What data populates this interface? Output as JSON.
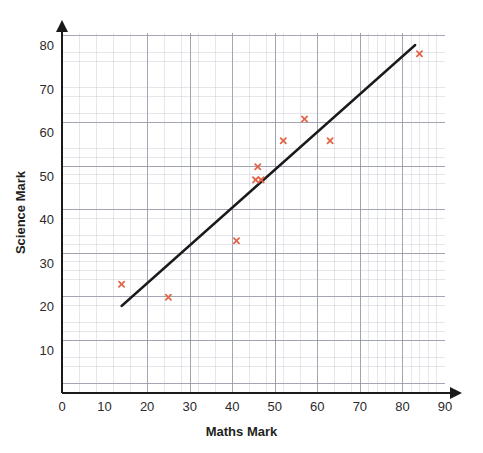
{
  "chart_data": {
    "type": "scatter",
    "title": "",
    "xlabel": "Maths Mark",
    "ylabel": "Science Mark",
    "xlim": [
      0,
      90
    ],
    "ylim": [
      0,
      85
    ],
    "xticks": [
      0,
      10,
      20,
      30,
      40,
      50,
      60,
      70,
      80,
      90
    ],
    "yticks": [
      10,
      20,
      30,
      40,
      50,
      60,
      70,
      80
    ],
    "xtick_labels": [
      "0",
      "10",
      "20",
      "30",
      "40",
      "50",
      "60",
      "70",
      "80",
      "90"
    ],
    "ytick_labels": [
      "10",
      "20",
      "30",
      "40",
      "50",
      "60",
      "70",
      "80"
    ],
    "grid": true,
    "grid_major_step": 10,
    "grid_minor_step": 2,
    "legend": "none",
    "marker_symbol": "x",
    "marker_color": "#e0674a",
    "points": [
      {
        "x": 14,
        "y": 25
      },
      {
        "x": 25,
        "y": 22
      },
      {
        "x": 41,
        "y": 35
      },
      {
        "x": 46,
        "y": 52
      },
      {
        "x": 45.5,
        "y": 49
      },
      {
        "x": 46.8,
        "y": 49
      },
      {
        "x": 52,
        "y": 58
      },
      {
        "x": 57,
        "y": 63
      },
      {
        "x": 63,
        "y": 58
      },
      {
        "x": 84,
        "y": 78
      }
    ],
    "trend_line": {
      "name": "line of best fit",
      "color": "#1a1a1a",
      "x_start": 14,
      "y_start": 20,
      "x_end": 83,
      "y_end": 80
    },
    "axis_color": "#1a1a1a",
    "grid_major_color": "#787d8c",
    "grid_minor_color": "#aaafbe",
    "background_color": "#ffffff"
  }
}
